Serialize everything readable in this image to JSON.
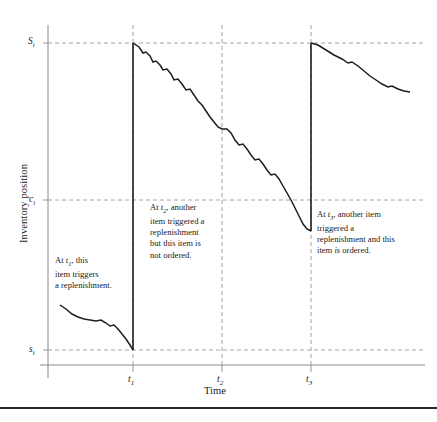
{
  "figure": {
    "background": "#ffffff",
    "ink_color": "#1d1d1d",
    "grid_color": "#9a9a9a",
    "axis_color": "#8a8a8a"
  },
  "axes": {
    "ylabel": "Inventory position",
    "xlabel": "Time",
    "y_ticks": [
      {
        "key": "S",
        "base": "S",
        "sub": "i",
        "value_px": 43,
        "label": "S"
      },
      {
        "key": "c",
        "base": "c",
        "sub": "i",
        "value_px": 200,
        "label": "c"
      },
      {
        "key": "s",
        "base": "s",
        "sub": "i",
        "value_px": 350,
        "label": "s"
      }
    ],
    "x_ticks": [
      {
        "key": "t1",
        "base": "t",
        "sub": "1",
        "value_px": 133,
        "label": "t"
      },
      {
        "key": "t2",
        "base": "t",
        "sub": "2",
        "value_px": 222,
        "label": "t"
      },
      {
        "key": "t3",
        "base": "t",
        "sub": "3",
        "value_px": 311,
        "label": "t"
      }
    ]
  },
  "annotations": [
    {
      "id": "annotation-t1",
      "lines": [
        {
          "parts": [
            {
              "t": "At ",
              "style": "normal"
            },
            {
              "t": "t",
              "style": "italic"
            },
            {
              "t": "1",
              "style": "sub"
            },
            {
              "t": ", this",
              "style": "normal"
            }
          ]
        },
        {
          "parts": [
            {
              "t": "item triggers",
              "style": "normal"
            }
          ]
        },
        {
          "parts": [
            {
              "t": "a replenishment.",
              "style": "normal"
            }
          ]
        }
      ]
    },
    {
      "id": "annotation-t2",
      "lines": [
        {
          "parts": [
            {
              "t": "At ",
              "style": "normal"
            },
            {
              "t": "t",
              "style": "italic"
            },
            {
              "t": "2",
              "style": "sub"
            },
            {
              "t": ", another",
              "style": "normal"
            }
          ]
        },
        {
          "parts": [
            {
              "t": "item triggered a",
              "style": "normal"
            }
          ]
        },
        {
          "parts": [
            {
              "t": "replenishment",
              "style": "normal"
            }
          ]
        },
        {
          "parts": [
            {
              "t": "but this item is",
              "style": "normal"
            }
          ]
        },
        {
          "parts": [
            {
              "t": "not ordered.",
              "style": "normal"
            }
          ]
        }
      ]
    },
    {
      "id": "annotation-t3",
      "lines": [
        {
          "parts": [
            {
              "t": "At ",
              "style": "normal"
            },
            {
              "t": "t",
              "style": "italic"
            },
            {
              "t": "3",
              "style": "sub"
            },
            {
              "t": ", another item",
              "style": "normal"
            }
          ]
        },
        {
          "parts": [
            {
              "t": "triggered a",
              "style": "normal"
            }
          ]
        },
        {
          "parts": [
            {
              "t": "replenishment and this",
              "style": "normal"
            }
          ]
        },
        {
          "parts": [
            {
              "t": "item ",
              "style": "normal"
            },
            {
              "t": "is",
              "style": "italic"
            },
            {
              "t": " ordered.",
              "style": "normal"
            }
          ]
        }
      ]
    }
  ],
  "chart_data": {
    "type": "line",
    "title": "",
    "xlabel": "Time",
    "ylabel": "Inventory position",
    "grid": true,
    "legend": "none",
    "levels": {
      "S": "S_i (order-up-to level)",
      "c": "c_i (can-order point)",
      "s": "s_i (reorder point)"
    },
    "events": [
      {
        "time": "t1",
        "type": "replenishment",
        "acted": true,
        "note": "this item triggers a replenishment"
      },
      {
        "time": "t2",
        "type": "joint-opportunity",
        "acted": false,
        "note": "another item triggered a replenishment but this item is not ordered"
      },
      {
        "time": "t3",
        "type": "joint-opportunity",
        "acted": true,
        "note": "another item triggered a replenishment and this item is ordered"
      }
    ],
    "series": [
      {
        "name": "Inventory position",
        "segments": [
          {
            "name": "pre-t1-depletion",
            "points": [
              [
                60,
                305
              ],
              [
                66,
                309
              ],
              [
                72,
                314
              ],
              [
                78,
                317
              ],
              [
                84,
                319
              ],
              [
                90,
                320
              ],
              [
                96,
                321
              ],
              [
                101,
                320
              ],
              [
                106,
                323
              ],
              [
                110,
                326
              ],
              [
                114,
                325
              ],
              [
                118,
                329
              ],
              [
                122,
                334
              ],
              [
                126,
                339
              ],
              [
                130,
                345
              ],
              [
                133,
                350
              ]
            ]
          },
          {
            "name": "t1-replenishment-jump",
            "points": [
              [
                133,
                350
              ],
              [
                133,
                43
              ]
            ]
          },
          {
            "name": "t1-to-t3-depletion",
            "points": [
              [
                133,
                43
              ],
              [
                139,
                47
              ],
              [
                143,
                53
              ],
              [
                146,
                52
              ],
              [
                150,
                56
              ],
              [
                153,
                62
              ],
              [
                156,
                61
              ],
              [
                160,
                65
              ],
              [
                163,
                70
              ],
              [
                167,
                69
              ],
              [
                171,
                74
              ],
              [
                174,
                80
              ],
              [
                178,
                79
              ],
              [
                182,
                84
              ],
              [
                186,
                90
              ],
              [
                190,
                89
              ],
              [
                194,
                95
              ],
              [
                198,
                101
              ],
              [
                202,
                105
              ],
              [
                206,
                111
              ],
              [
                210,
                117
              ],
              [
                214,
                122
              ],
              [
                218,
                127
              ],
              [
                222,
                129
              ],
              [
                227,
                129
              ],
              [
                231,
                133
              ],
              [
                235,
                140
              ],
              [
                239,
                145
              ],
              [
                243,
                144
              ],
              [
                247,
                149
              ],
              [
                251,
                155
              ],
              [
                255,
                160
              ],
              [
                259,
                159
              ],
              [
                263,
                164
              ],
              [
                267,
                170
              ],
              [
                271,
                175
              ],
              [
                275,
                174
              ],
              [
                279,
                179
              ],
              [
                283,
                186
              ],
              [
                287,
                193
              ],
              [
                291,
                200
              ],
              [
                295,
                208
              ],
              [
                299,
                216
              ],
              [
                303,
                224
              ],
              [
                307,
                229
              ],
              [
                311,
                231
              ]
            ]
          },
          {
            "name": "t3-replenishment-jump",
            "points": [
              [
                311,
                231
              ],
              [
                311,
                43
              ]
            ]
          },
          {
            "name": "post-t3-depletion",
            "points": [
              [
                311,
                43
              ],
              [
                318,
                45
              ],
              [
                326,
                50
              ],
              [
                334,
                55
              ],
              [
                342,
                59
              ],
              [
                348,
                63
              ],
              [
                352,
                62
              ],
              [
                358,
                66
              ],
              [
                364,
                71
              ],
              [
                370,
                76
              ],
              [
                376,
                80
              ],
              [
                382,
                84
              ],
              [
                388,
                87
              ],
              [
                392,
                86
              ],
              [
                398,
                89
              ],
              [
                404,
                91
              ],
              [
                410,
                92
              ]
            ]
          }
        ]
      }
    ],
    "axis_geometry": {
      "plot_left_px": 48,
      "plot_right_px": 425,
      "plot_top_px": 25,
      "plot_bottom_px": 365
    }
  }
}
